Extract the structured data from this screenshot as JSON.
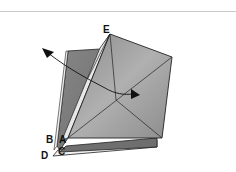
{
  "diagram": {
    "type": "origami-fold-step",
    "labels": {
      "E": "E",
      "A": "A",
      "B": "B",
      "C": "C",
      "D": "D"
    },
    "arrow": {
      "kind": "fold-arrow",
      "direction": "curved, from upper-left toward center-right"
    },
    "colors": {
      "front_square_light": "#a6a6a6",
      "front_square_dark": "#7a7a7a",
      "back_sheet": "#7d7d7d",
      "white_strip": "#e8e8e8",
      "outline": "#222222",
      "rule": "#c8c8c8"
    }
  }
}
